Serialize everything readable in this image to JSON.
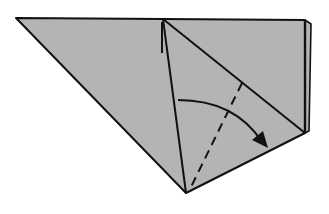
{
  "diagram": {
    "type": "origami-fold-step",
    "colors": {
      "paper": "#b4b4b4",
      "line": "#111111",
      "background": "#ffffff"
    },
    "shapes": {
      "back_layer": "305,20 311,24 309,131 305,133",
      "main_paper": "16,18 163,19 305,20 305,133 186,193",
      "top_edge": [
        16,
        18,
        305,
        20
      ],
      "left_edge": [
        16,
        18,
        186,
        193
      ],
      "center_crease": [
        163,
        19,
        186,
        193
      ],
      "diagonal_edge": [
        163,
        19,
        305,
        133
      ],
      "bottom_edge": [
        186,
        193,
        305,
        133
      ],
      "right_edge": [
        305,
        20,
        305,
        133
      ]
    },
    "fold_line": {
      "style": "valley-fold-dashed",
      "x1": 242,
      "y1": 83,
      "x2": 191,
      "y2": 187
    },
    "fold_arrow": {
      "path": "M 178 100 Q 235 100 262 142",
      "head": "268,148 252,140 263,131"
    },
    "lift_arrow": {
      "x1": 162,
      "y1": 53,
      "x2": 162,
      "y2": 22
    }
  }
}
